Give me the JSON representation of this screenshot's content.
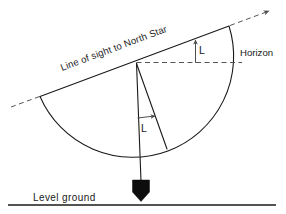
{
  "diagram": {
    "labels": {
      "line_of_sight": "Line of sight to North Star",
      "horizon": "Horizon",
      "level_ground": "Level ground",
      "angle_upper": "L",
      "angle_lower": "L"
    },
    "colors": {
      "stroke": "#1a1a1a",
      "dashed": "#555555",
      "annotation": "#4d4d4d",
      "plumb_bob": "#0d0d0d",
      "background": "#ffffff"
    },
    "elements": {
      "line_of_sight_solid": "solid line from lower-left to upper-right through the vertex",
      "line_of_sight_dashed_extensions": "dashed continuations at both ends with an arrowhead pointing up-right",
      "horizon_dashed": "horizontal dashed reference line from the vertex to the right",
      "protractor_arc": "semicircular arc centered on the vertex",
      "plumb_line": "vertical line from the vertex down to the plumb bob",
      "angle_line": "straight line from the vertex to the arc marking angle L",
      "upper_angle_arrow": "vertical arrow from the horizon up to the line of sight labeled L",
      "lower_angle_arrow": "horizontal arrow from the plumb line to the angle line labeled L",
      "ground_line": "horizontal line representing level ground"
    }
  }
}
